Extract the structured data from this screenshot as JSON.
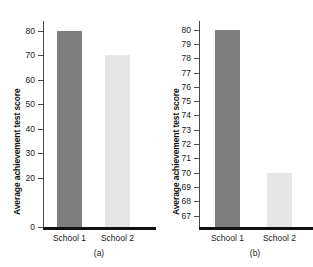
{
  "figure": {
    "panels": [
      {
        "caption": "(a)",
        "ylabel": "Average achievement test score",
        "chart_data": {
          "type": "bar",
          "title": "",
          "xlabel": "",
          "ylabel": "Average achievement test score",
          "categories": [
            "School 1",
            "School 2"
          ],
          "values": [
            80,
            70
          ],
          "ylim": [
            0,
            84
          ],
          "yticks": [
            0,
            20,
            30,
            40,
            50,
            60,
            70,
            80
          ],
          "ytick_labels": [
            "0",
            "20",
            "30",
            "40",
            "50",
            "60",
            "70",
            "80"
          ],
          "grid": false,
          "legend": null,
          "bar_colors": [
            "#7e7e7e",
            "#e6e6e6"
          ]
        }
      },
      {
        "caption": "(b)",
        "ylabel": "Average achievement test score",
        "chart_data": {
          "type": "bar",
          "title": "",
          "xlabel": "",
          "ylabel": "Average achievement test score",
          "categories": [
            "School 1",
            "School 2"
          ],
          "values": [
            80,
            70
          ],
          "ylim": [
            66.2,
            80.6
          ],
          "yticks": [
            67,
            68,
            69,
            70,
            71,
            72,
            73,
            74,
            75,
            76,
            77,
            78,
            79,
            80
          ],
          "ytick_labels": [
            "67",
            "68",
            "69",
            "70",
            "71",
            "72",
            "73",
            "74",
            "75",
            "76",
            "77",
            "78",
            "79",
            "80"
          ],
          "grid": false,
          "legend": null,
          "bar_colors": [
            "#7e7e7e",
            "#e6e6e6"
          ]
        }
      }
    ]
  }
}
